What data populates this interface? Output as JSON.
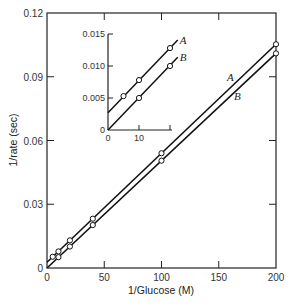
{
  "chart_data": {
    "type": "line",
    "title": "",
    "xlabel": "1/Glucose (M)",
    "ylabel": "1/rate (sec)",
    "xlim": [
      0,
      200
    ],
    "ylim": [
      0,
      0.12
    ],
    "x_ticks": [
      0,
      50,
      100,
      150,
      200
    ],
    "y_ticks": [
      0,
      0.03,
      0.06,
      0.09,
      0.12
    ],
    "x_tick_labels": [
      "0",
      "50",
      "100",
      "150",
      "200"
    ],
    "y_tick_labels": [
      "0",
      "0.03",
      "0.06",
      "0.09",
      "0.12"
    ],
    "grid": false,
    "legend": "inline labels near lines",
    "series": [
      {
        "name": "A",
        "marker": "open-circle",
        "points": [
          {
            "x": 5,
            "y": 0.0053
          },
          {
            "x": 10,
            "y": 0.0078
          },
          {
            "x": 20,
            "y": 0.013
          },
          {
            "x": 40,
            "y": 0.0232
          },
          {
            "x": 100,
            "y": 0.054
          },
          {
            "x": 200,
            "y": 0.1053
          }
        ],
        "fit": {
          "intercept": 0.0027,
          "slope": 0.000513
        }
      },
      {
        "name": "B",
        "marker": "open-circle",
        "points": [
          {
            "x": 10,
            "y": 0.0051
          },
          {
            "x": 20,
            "y": 0.0101
          },
          {
            "x": 40,
            "y": 0.0202
          },
          {
            "x": 100,
            "y": 0.0505
          },
          {
            "x": 200,
            "y": 0.101
          }
        ],
        "fit": {
          "intercept": 0.0,
          "slope": 0.000505
        }
      }
    ],
    "inset": {
      "xlim": [
        0,
        20
      ],
      "ylim": [
        0,
        0.015
      ],
      "x_ticks": [
        0,
        10,
        20
      ],
      "x_tick_labels": [
        "0",
        "10",
        ""
      ],
      "y_ticks": [
        0,
        0.005,
        0.01,
        0.015
      ],
      "y_tick_labels": [
        "0",
        "0.005",
        "0.010",
        "0.015"
      ],
      "series": [
        {
          "name": "A",
          "points": [
            {
              "x": 5,
              "y": 0.0053
            },
            {
              "x": 10,
              "y": 0.0078
            },
            {
              "x": 20,
              "y": 0.0128
            }
          ]
        },
        {
          "name": "B",
          "points": [
            {
              "x": 10,
              "y": 0.005
            },
            {
              "x": 20,
              "y": 0.01
            }
          ]
        }
      ]
    }
  }
}
